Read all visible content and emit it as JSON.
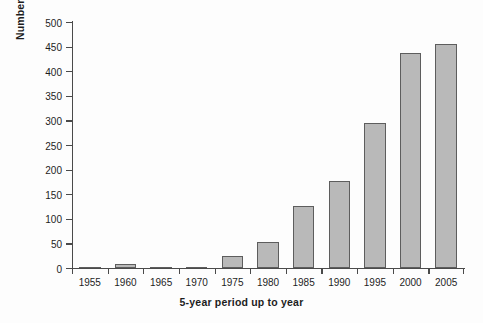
{
  "chart_data": {
    "type": "bar",
    "title": "",
    "xlabel": "5-year period up to year",
    "ylabel": "Number of exercise immunology publications",
    "categories": [
      "1955",
      "1960",
      "1965",
      "1970",
      "1975",
      "1980",
      "1985",
      "1990",
      "1995",
      "2000",
      "2005"
    ],
    "values": [
      1,
      8,
      0,
      2,
      25,
      52,
      127,
      177,
      295,
      437,
      455
    ],
    "ylim": [
      0,
      500
    ],
    "ytick_values": [
      0,
      50,
      100,
      150,
      200,
      250,
      300,
      350,
      400,
      450,
      500
    ],
    "ytick_labels": [
      "0",
      "50",
      "100",
      "150",
      "200",
      "250",
      "300",
      "350",
      "400",
      "450",
      "500"
    ],
    "grid": false,
    "legend": false,
    "bar_color": "#b9b9b9",
    "bar_edge_color": "#5d5d5d",
    "axis_color": "#4a4a4a",
    "background_color": "#fdfdfd",
    "text_color": "#1d1d1d"
  }
}
